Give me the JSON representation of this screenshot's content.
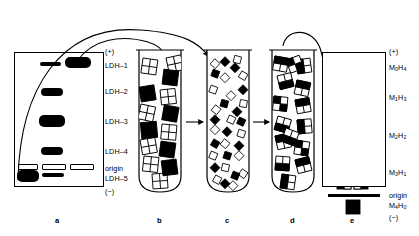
{
  "figure": {
    "panels": [
      {
        "id": "a",
        "label": "a",
        "kind": "electrophoresis-gel"
      },
      {
        "id": "b",
        "label": "b",
        "kind": "test-tube"
      },
      {
        "id": "c",
        "label": "c",
        "kind": "test-tube"
      },
      {
        "id": "d",
        "label": "d",
        "kind": "test-tube"
      },
      {
        "id": "e",
        "label": "e",
        "kind": "electrophoresis-gel"
      }
    ]
  },
  "colors": {
    "ink": "#000000",
    "paper": "#ffffff",
    "m_subunit": "#000000",
    "h_subunit": "#ffffff"
  },
  "center_labels": {
    "polarity_top": "(+)",
    "polarity_bottom": "(−)",
    "origin": "origin",
    "isozymes": [
      "LDH–1",
      "LDH–2",
      "LDH–3",
      "LDH–4",
      "LDH–5"
    ]
  },
  "right_labels": {
    "polarity_top": "(+)",
    "polarity_bottom": "(−)",
    "origin": "origin",
    "compositions": [
      {
        "m": "0",
        "h": "4",
        "text": "M0H4"
      },
      {
        "m": "1",
        "h": "3",
        "text": "M1H3"
      },
      {
        "m": "2",
        "h": "2",
        "text": "M2H2"
      },
      {
        "m": "3",
        "h": "1",
        "text": "M3H1"
      },
      {
        "m": "4",
        "h": "0",
        "text": "M4H0"
      }
    ]
  },
  "panel_a": {
    "lanes": 3,
    "description": "Starting gel with two pure parental isozyme samples plus mixture",
    "bands": [
      {
        "lane": 2,
        "row": "LDH-1",
        "style": "thin-filled"
      },
      {
        "lane": 3,
        "row": "LDH-1",
        "style": "thick-filled"
      },
      {
        "lane": 2,
        "row": "LDH-3",
        "style": "thick-filled"
      },
      {
        "lane": 2,
        "row": "LDH-4",
        "style": "medium-filled"
      },
      {
        "lane": 1,
        "row": "origin",
        "style": "hollow"
      },
      {
        "lane": 2,
        "row": "origin",
        "style": "hollow"
      },
      {
        "lane": 3,
        "row": "origin",
        "style": "hollow"
      },
      {
        "lane": 1,
        "row": "LDH-5",
        "style": "thick-filled"
      },
      {
        "lane": 2,
        "row": "LDH-5",
        "style": "thin-filled"
      }
    ]
  },
  "panel_b": {
    "contents": "Intact tetramers: pure H4 (open) and pure M4 (solid) isozymes mixed"
  },
  "panel_c": {
    "contents": "Dissociated free subunits: open H monomers and solid M monomers"
  },
  "panel_d": {
    "contents": "Reassociated random hybrid tetramers"
  },
  "panel_e": {
    "bands": [
      {
        "composition": "M0H4",
        "count": 1,
        "black_quadrants": 0
      },
      {
        "composition": "M1H3",
        "count": 4,
        "black_quadrants": 1
      },
      {
        "composition": "M2H2",
        "count": 6,
        "black_quadrants": 2
      },
      {
        "composition": "M3H1",
        "count": 4,
        "black_quadrants": 3
      },
      {
        "composition": "M4H0",
        "count": 1,
        "black_quadrants": 4
      }
    ]
  },
  "arrows": [
    {
      "from": "a",
      "to": "b",
      "style": "curved"
    },
    {
      "from": "a",
      "to": "b",
      "style": "curved"
    },
    {
      "from": "b",
      "to": "c",
      "style": "straight"
    },
    {
      "from": "c",
      "to": "d",
      "style": "straight"
    },
    {
      "from": "d",
      "to": "e",
      "style": "curved"
    }
  ]
}
